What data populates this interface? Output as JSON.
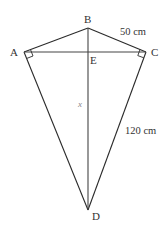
{
  "diagram": {
    "type": "kite",
    "points": {
      "A": {
        "label": "A",
        "x": 24,
        "y": 52
      },
      "B": {
        "label": "B",
        "x": 88,
        "y": 28
      },
      "C": {
        "label": "C",
        "x": 146,
        "y": 52
      },
      "D": {
        "label": "D",
        "x": 88,
        "y": 210
      },
      "E": {
        "label": "E",
        "x": 88,
        "y": 52
      }
    },
    "measurements": {
      "BC": "50 cm",
      "CD": "120 cm",
      "BD": "x"
    },
    "right_angles": [
      "A",
      "C"
    ],
    "colors": {
      "stroke": "#2a2a2a",
      "text": "#333333",
      "variable": "#888888"
    }
  }
}
